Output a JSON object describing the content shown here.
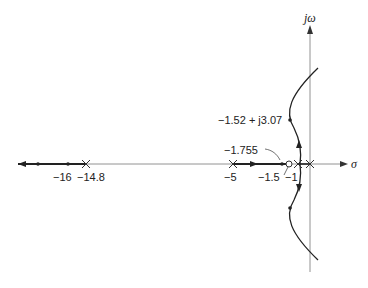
{
  "diagram": {
    "type": "root-locus",
    "axes": {
      "real_axis_label": "σ",
      "imag_axis_label": "jω"
    },
    "poles": [
      {
        "value": "-14.8",
        "label": "−14.8"
      },
      {
        "value": "-5",
        "label": "−5"
      },
      {
        "value": "-1",
        "label": "−1"
      },
      {
        "value": "0",
        "label": ""
      }
    ],
    "zeros": [
      {
        "value": "-1.5",
        "label": "−1.5"
      }
    ],
    "points": [
      {
        "value": "-16",
        "label": "−16"
      },
      {
        "value": "-1.755",
        "label": "−1.755"
      },
      {
        "value": "-1.52 + j3.07",
        "label": "−1.52 + j3.07"
      }
    ],
    "colors": {
      "locus": "#222222",
      "axis": "#555555",
      "background": "#ffffff"
    }
  }
}
